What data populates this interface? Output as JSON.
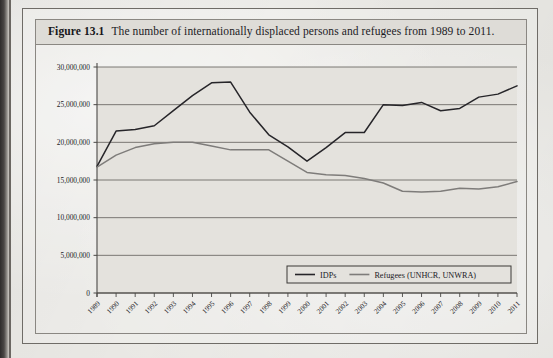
{
  "figure": {
    "label": "Figure 13.1",
    "caption": "The number of internationally displaced persons and refugees from 1989 to 2011."
  },
  "colors": {
    "idp_line": "#262529",
    "refugee_line": "#7e7c7a",
    "gridline": "#6e6b68",
    "axis": "#4a4845",
    "plot_background": "#e4e2dd",
    "page_background": "#e9e8e4",
    "frame": "#6f6c67",
    "caption_background": "#dedcd7"
  },
  "axis": {
    "y_ticks": [
      "0",
      "5,000,000",
      "10,000,000",
      "15,000,000",
      "20,000,000",
      "25,000,000",
      "30,000,000"
    ],
    "x_ticks": [
      "1989",
      "1990",
      "1991",
      "1992",
      "1993",
      "1994",
      "1995",
      "1996",
      "1997",
      "1998",
      "1999",
      "2000",
      "2001",
      "2002",
      "2003",
      "2004",
      "2005",
      "2006",
      "2007",
      "2008",
      "2009",
      "2010",
      "2011"
    ]
  },
  "legend": {
    "items": [
      {
        "label": "IDPs",
        "color": "#262529"
      },
      {
        "label": "Refugees (UNHCR, UNWRA)",
        "color": "#7e7c7a"
      }
    ]
  },
  "chart_data": {
    "type": "line",
    "title": "The number of internationally displaced persons and refugees from 1989 to 2011.",
    "xlabel": "",
    "ylabel": "",
    "ylim": [
      0,
      30000000
    ],
    "ytick_interval": 5000000,
    "grid": true,
    "legend_position": "bottom-right",
    "categories": [
      "1989",
      "1990",
      "1991",
      "1992",
      "1993",
      "1994",
      "1995",
      "1996",
      "1997",
      "1998",
      "1999",
      "2000",
      "2001",
      "2002",
      "2003",
      "2004",
      "2005",
      "2006",
      "2007",
      "2008",
      "2009",
      "2010",
      "2011"
    ],
    "series": [
      {
        "name": "IDPs",
        "color": "#262529",
        "values": [
          16800000,
          21500000,
          21700000,
          22200000,
          24200000,
          26200000,
          27900000,
          28000000,
          24000000,
          21000000,
          19400000,
          17500000,
          19300000,
          21300000,
          21300000,
          25000000,
          24900000,
          25300000,
          24200000,
          24500000,
          26000000,
          26400000,
          27500000
        ]
      },
      {
        "name": "Refugees (UNHCR, UNWRA)",
        "color": "#7e7c7a",
        "values": [
          16700000,
          18300000,
          19300000,
          19800000,
          20000000,
          20000000,
          19500000,
          19000000,
          19000000,
          19000000,
          17500000,
          16000000,
          15700000,
          15600000,
          15200000,
          14600000,
          13500000,
          13400000,
          13500000,
          13900000,
          13800000,
          14100000,
          14800000
        ]
      }
    ]
  }
}
